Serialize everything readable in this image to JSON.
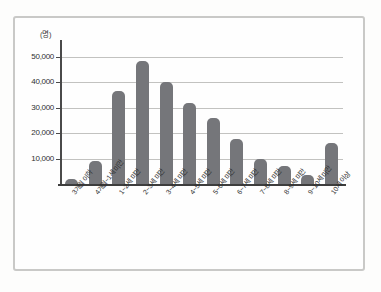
{
  "chart_data": {
    "type": "bar",
    "title": "",
    "subtitle": "",
    "xlabel": "",
    "ylabel": "",
    "unit_label": "(명)",
    "categories": [
      "3개월 이하",
      "4개월~1세 미만",
      "1~2세 미만",
      "2~3세 미만",
      "3~4세 미만",
      "4~5세 미만",
      "5~6세 미만",
      "6~7세 미만",
      "7~8세 미만",
      "8~9세 미만",
      "9~10세 미만",
      "10세 이상"
    ],
    "values": [
      2000,
      9000,
      36500,
      48500,
      40000,
      31800,
      25800,
      17800,
      10000,
      7200,
      3500,
      16000
    ],
    "ylim": [
      0,
      55000
    ],
    "yticks": [
      10000,
      20000,
      30000,
      40000,
      50000
    ],
    "ytick_labels": [
      "10,000",
      "20,000",
      "30,000",
      "40,000",
      "50,000"
    ],
    "grid": true,
    "legend": false,
    "legend_position": "none",
    "bar_color": "#75767a",
    "gridline_color": "#c2c2c0",
    "axis_color": "#3d3d3d",
    "frame_color": "#c9c9c7",
    "background": "#fefefe"
  }
}
